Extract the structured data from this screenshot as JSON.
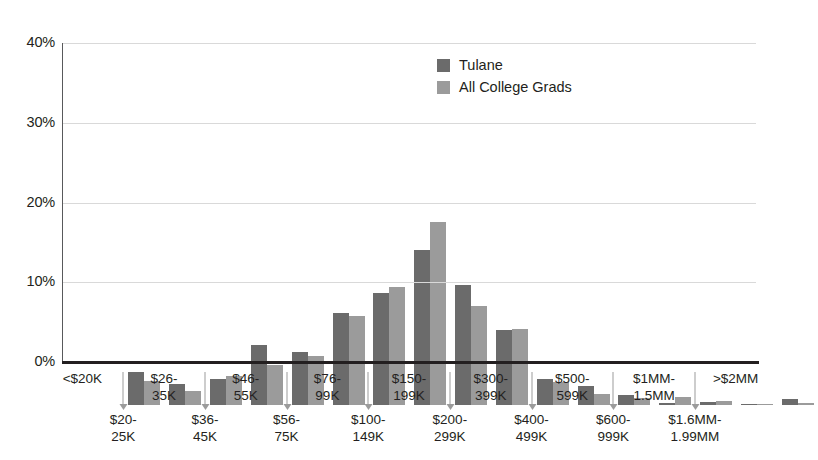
{
  "chart_data": {
    "type": "bar",
    "title": "",
    "subtitle": "",
    "xlabel": "",
    "ylabel": "",
    "ylim": [
      0,
      40
    ],
    "yticks": [
      "0%",
      "10%",
      "20%",
      "30%",
      "40%"
    ],
    "ytick_values": [
      0,
      10,
      20,
      30,
      40
    ],
    "grid": true,
    "legend_position": "top-right",
    "categories": [
      "<$20K",
      "$20-\n25K",
      "$26-\n35K",
      "$36-\n45K",
      "$46-\n55K",
      "$56-\n75K",
      "$76-\n99K",
      "$100-\n149K",
      "$150-\n199K",
      "$200-\n299K",
      "$300-\n399K",
      "$400-\n499K",
      "$500-\n599K",
      "$600-\n999K",
      "$1MM-\n1.5MM",
      "$1.6MM-\n1.99MM",
      ">$2MM"
    ],
    "series": [
      {
        "name": "Tulane",
        "color": "#6b6b6b",
        "values": [
          4.2,
          2.6,
          3.2,
          7.5,
          6.6,
          11.6,
          14.0,
          19.5,
          15.1,
          9.4,
          3.2,
          2.4,
          1.2,
          0.3,
          0.4,
          0.15,
          0.7
        ]
      },
      {
        "name": "All College Grads",
        "color": "#9b9b9b",
        "values": [
          3.0,
          1.8,
          3.6,
          5.0,
          6.1,
          11.2,
          14.8,
          23.0,
          12.4,
          9.5,
          2.9,
          1.4,
          0.9,
          1.0,
          0.45,
          0.1,
          0.3
        ]
      }
    ]
  },
  "axis": {
    "y_ticks": [
      {
        "label": "40%",
        "value": 40
      },
      {
        "label": "30%",
        "value": 30
      },
      {
        "label": "20%",
        "value": 20
      },
      {
        "label": "10%",
        "value": 10
      },
      {
        "label": "0%",
        "value": 0
      }
    ]
  },
  "x_axis_labels": [
    {
      "text": "<$20K",
      "row": "top",
      "arrow": false
    },
    {
      "text": "$20-\n25K",
      "row": "bot",
      "arrow": true
    },
    {
      "text": "$26-\n35K",
      "row": "top",
      "arrow": false
    },
    {
      "text": "$36-\n45K",
      "row": "bot",
      "arrow": true
    },
    {
      "text": "$46-\n55K",
      "row": "top",
      "arrow": false
    },
    {
      "text": "$56-\n75K",
      "row": "bot",
      "arrow": true
    },
    {
      "text": "$76-\n99K",
      "row": "top",
      "arrow": false
    },
    {
      "text": "$100-\n149K",
      "row": "bot",
      "arrow": true
    },
    {
      "text": "$150-\n199K",
      "row": "top",
      "arrow": false
    },
    {
      "text": "$200-\n299K",
      "row": "bot",
      "arrow": true
    },
    {
      "text": "$300-\n399K",
      "row": "top",
      "arrow": false
    },
    {
      "text": "$400-\n499K",
      "row": "bot",
      "arrow": true
    },
    {
      "text": "$500-\n599K",
      "row": "top",
      "arrow": false
    },
    {
      "text": "$600-\n999K",
      "row": "bot",
      "arrow": true
    },
    {
      "text": "$1MM-\n1.5MM",
      "row": "top",
      "arrow": false
    },
    {
      "text": "$1.6MM-\n1.99MM",
      "row": "bot",
      "arrow": true
    },
    {
      "text": ">$2MM",
      "row": "top",
      "arrow": false
    }
  ],
  "legend": {
    "items": [
      {
        "label": "Tulane",
        "color": "#6b6b6b"
      },
      {
        "label": "All College Grads",
        "color": "#9b9b9b"
      }
    ]
  },
  "colors": {
    "series_dark": "#6b6b6b",
    "series_light": "#9b9b9b",
    "gridline": "#d9d9d9",
    "axis": "#231f20",
    "text": "#231f20",
    "background": "#ffffff"
  }
}
